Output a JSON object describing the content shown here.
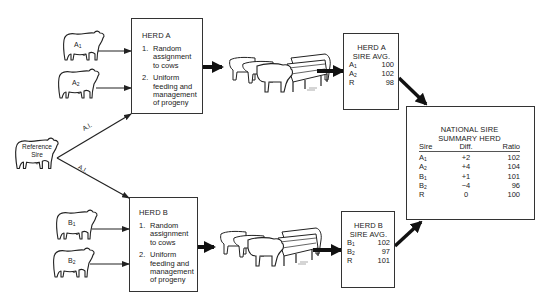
{
  "reference_sire": {
    "label_line1": "Reference",
    "label_line2": "Sire"
  },
  "ai_label": "A.I.",
  "sires_a": [
    {
      "label": "A",
      "sub": "1"
    },
    {
      "label": "A",
      "sub": "2"
    }
  ],
  "sires_b": [
    {
      "label": "B",
      "sub": "1"
    },
    {
      "label": "B",
      "sub": "2"
    }
  ],
  "herd_a": {
    "title": "HERD A",
    "steps": [
      {
        "num": "1.",
        "text": "Random assignment to cows"
      },
      {
        "num": "2.",
        "text": "Uniform feeding and management of progeny"
      }
    ]
  },
  "herd_b": {
    "title": "HERD B",
    "steps": [
      {
        "num": "1.",
        "text": "Random assignment to cows"
      },
      {
        "num": "2.",
        "text": "Uniform feeding and management of progeny"
      }
    ]
  },
  "herd_a_avg": {
    "title_line1": "HERD A",
    "title_line2": "SIRE AVG.",
    "rows": [
      {
        "sire": "A",
        "sub": "1",
        "value": "100"
      },
      {
        "sire": "A",
        "sub": "2",
        "value": "102"
      },
      {
        "sire": "R",
        "sub": "",
        "value": "98"
      }
    ]
  },
  "herd_b_avg": {
    "title_line1": "HERD B",
    "title_line2": "SIRE AVG.",
    "rows": [
      {
        "sire": "B",
        "sub": "1",
        "value": "102"
      },
      {
        "sire": "B",
        "sub": "2",
        "value": "97"
      },
      {
        "sire": "R",
        "sub": "",
        "value": "101"
      }
    ]
  },
  "summary": {
    "title_line1": "NATIONAL SIRE",
    "title_line2": "SUMMARY HERD",
    "headers": {
      "sire": "Sire",
      "diff": "Diff.",
      "ratio": "Ratio"
    },
    "rows": [
      {
        "sire": "A",
        "sub": "1",
        "diff": "+2",
        "ratio": "102"
      },
      {
        "sire": "A",
        "sub": "2",
        "diff": "+4",
        "ratio": "104"
      },
      {
        "sire": "B",
        "sub": "1",
        "diff": "+1",
        "ratio": "101"
      },
      {
        "sire": "B",
        "sub": "2",
        "diff": "−4",
        "ratio": "96"
      },
      {
        "sire": "R",
        "sub": "",
        "diff": "0",
        "ratio": "100"
      }
    ]
  }
}
